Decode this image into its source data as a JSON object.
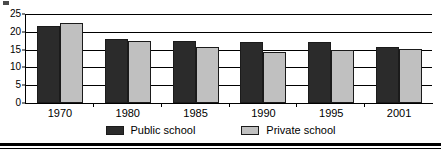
{
  "chart_data": {
    "type": "bar",
    "title": "",
    "xlabel": "",
    "ylabel": "",
    "categories": [
      "1970",
      "1980",
      "1985",
      "1990",
      "1995",
      "2001"
    ],
    "series": [
      {
        "name": "Public school",
        "color": "#2b2b2b",
        "values": [
          21.5,
          18.1,
          17.4,
          17.2,
          17.2,
          15.7
        ]
      },
      {
        "name": "Private school",
        "color": "#c0c0c0",
        "values": [
          22.5,
          17.4,
          15.8,
          14.3,
          15.0,
          15.2
        ]
      }
    ],
    "ylim": [
      0,
      25
    ],
    "yticks": [
      0,
      5,
      10,
      15,
      20,
      25
    ],
    "ytick_labels": [
      "0",
      "5",
      "10",
      "15",
      "20",
      "25"
    ],
    "grid": true,
    "legend_position": "bottom"
  }
}
